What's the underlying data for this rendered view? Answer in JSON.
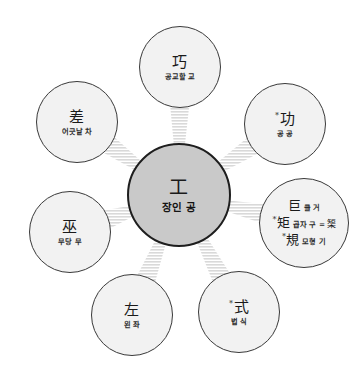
{
  "diagram": {
    "type": "radial-node-graph",
    "background_color": "#ffffff",
    "center_fill": "#c9c9c9",
    "center_stroke": "#1e1e1e",
    "node_fill": "#f2f2f2",
    "node_stroke": "#3a3a3a",
    "connector_color": "#d9d9d9",
    "connector_style": "striped-band"
  },
  "center": {
    "id": "center-gong",
    "han": "工",
    "gloss": "장인 공",
    "cx": 179,
    "cy": 195,
    "r": 52
  },
  "nodes": [
    {
      "id": "node-gyo",
      "han": "巧",
      "gloss": "공교할 교",
      "mark": "",
      "cx": 180,
      "cy": 67,
      "r": 41,
      "position": "top"
    },
    {
      "id": "node-gong-merit",
      "han": "功",
      "gloss": "공 공",
      "mark": "*",
      "cx": 285,
      "cy": 124,
      "r": 41,
      "position": "upper-right"
    },
    {
      "id": "node-geo",
      "han": "巨",
      "gloss": "클 거",
      "mark": "",
      "cx": 304,
      "cy": 223,
      "r": 45,
      "position": "right",
      "lines": [
        {
          "han": "巨",
          "gloss": "클 거",
          "mark": ""
        },
        {
          "han": "矩",
          "gloss": "곱자 구",
          "mark": "*",
          "eq": "=",
          "eq_han": "榘"
        },
        {
          "han": "規",
          "gloss": "모형 기",
          "mark": "*"
        }
      ]
    },
    {
      "id": "node-sik",
      "han": "式",
      "gloss": "법 식",
      "mark": "*",
      "cx": 239,
      "cy": 312,
      "r": 41,
      "position": "lower-right"
    },
    {
      "id": "node-jwa",
      "han": "左",
      "gloss": "왼 좌",
      "mark": "",
      "cx": 132,
      "cy": 315,
      "r": 41,
      "position": "bottom-left"
    },
    {
      "id": "node-mu",
      "han": "巫",
      "gloss": "무당 무",
      "mark": "",
      "cx": 70,
      "cy": 232,
      "r": 41,
      "position": "left"
    },
    {
      "id": "node-cha",
      "han": "差",
      "gloss": "어긋날 차",
      "mark": "",
      "cx": 77,
      "cy": 122,
      "r": 41,
      "position": "upper-left"
    }
  ]
}
